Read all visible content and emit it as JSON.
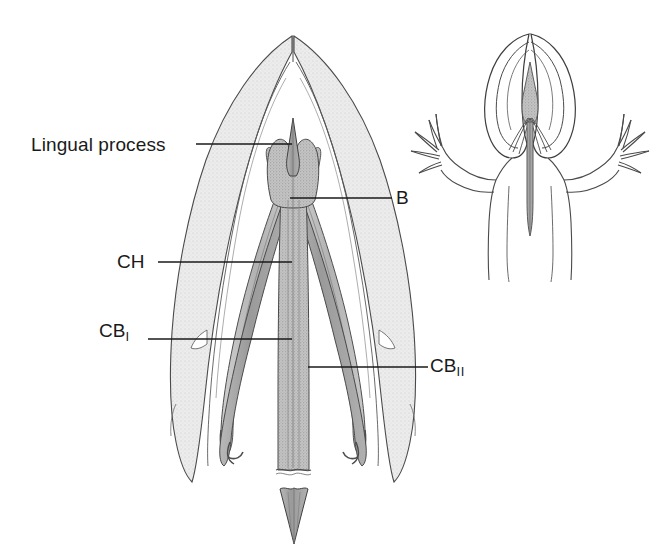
{
  "figure": {
    "kind": "anatomical-line-drawing",
    "background_color": "#ffffff",
    "line_color": "#3a3a3a",
    "fill_light_gray": "#e3e3e3",
    "fill_mid_gray": "#bdbdbd",
    "fill_dark_gray": "#9e9e9e",
    "leader_line_color": "#1a1a1a"
  },
  "labels": {
    "lingual_process": "Lingual process",
    "ch": "CH",
    "cb_one_base": "CB",
    "cb_one_sub": "I",
    "b": "B",
    "cb_two_base": "CB",
    "cb_two_sub": "II"
  },
  "insets": {
    "whole_animal": {
      "name": "whole-animal-dorsal-view",
      "description": "dorsal outline of salamander head, forelimbs and trunk with hyobranchial apparatus and projected tongue shown in place"
    }
  }
}
